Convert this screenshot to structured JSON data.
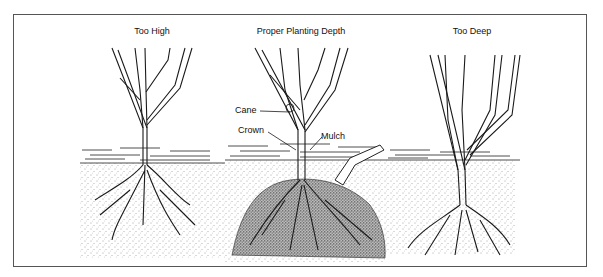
{
  "figure": {
    "panels": [
      {
        "id": "too-high",
        "title": "Too High"
      },
      {
        "id": "proper",
        "title": "Proper Planting Depth"
      },
      {
        "id": "too-deep",
        "title": "Too Deep"
      }
    ],
    "labels": {
      "cane": "Cane",
      "crown": "Crown",
      "mulch": "Mulch"
    },
    "colors": {
      "ink": "#1a1a1a",
      "frame": "#555555",
      "background": "#ffffff"
    }
  }
}
